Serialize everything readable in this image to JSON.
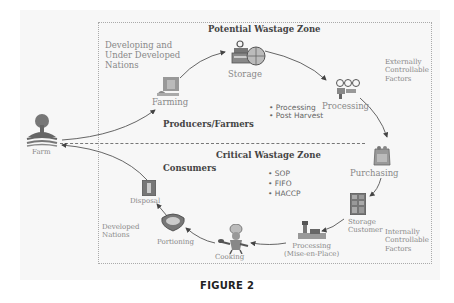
{
  "figure_label": "FIGURE 2",
  "zones": {
    "top_title": "Potential Wastage Zone",
    "bottom_title": "Critical Wastage Zone"
  },
  "groups": {
    "producers": "Producers/Farmers",
    "consumers": "Consumers"
  },
  "region_notes": {
    "developing": "Developing and\nUnder Developed\nNations",
    "developed": "Developed\nNations",
    "external": "Externally\nControllable\nFactors",
    "internal": "Internally\nControllable\nFactors"
  },
  "bullets_top": [
    "• Processing",
    "• Post Harvest"
  ],
  "bullets_bottom": [
    "• SOP",
    "• FIFO",
    "• HACCP"
  ],
  "nodes": {
    "farm": "Farm",
    "farming": "Farming",
    "storage": "Storage",
    "processing": "Processing",
    "purchasing": "Purchasing",
    "storage_customer": "Storage\nCustomer",
    "processing_mise": "Processing\n(Mise-en-Place)",
    "cooking": "Cooking",
    "portioning": "Portioning",
    "disposal": "Disposal"
  },
  "colors": {
    "background": "#f7f7f7",
    "arrow": "#444444",
    "text": "#777777",
    "heading": "#444444"
  }
}
